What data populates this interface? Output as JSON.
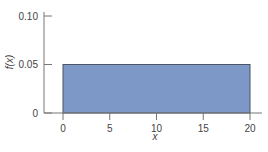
{
  "chart_data": {
    "type": "bar",
    "title": "",
    "xlabel": "x",
    "ylabel": "f(x)",
    "xlim": [
      0,
      20
    ],
    "ylim": [
      0,
      0.1
    ],
    "x_ticks": [
      0,
      5,
      10,
      15,
      20
    ],
    "x_tick_labels": [
      "0",
      "5",
      "10",
      "15",
      "20"
    ],
    "y_ticks": [
      0,
      0.05,
      0.1
    ],
    "y_tick_labels": [
      "0",
      "0.05",
      "0.10"
    ],
    "grid": false,
    "legend": "none",
    "series": [
      {
        "name": "f(x)",
        "x_start": 0,
        "x_end": 20,
        "value": 0.05
      }
    ],
    "colors": {
      "bar_fill": "#7d98c6",
      "bar_stroke": "#4a5563",
      "axis": "#777777"
    }
  }
}
